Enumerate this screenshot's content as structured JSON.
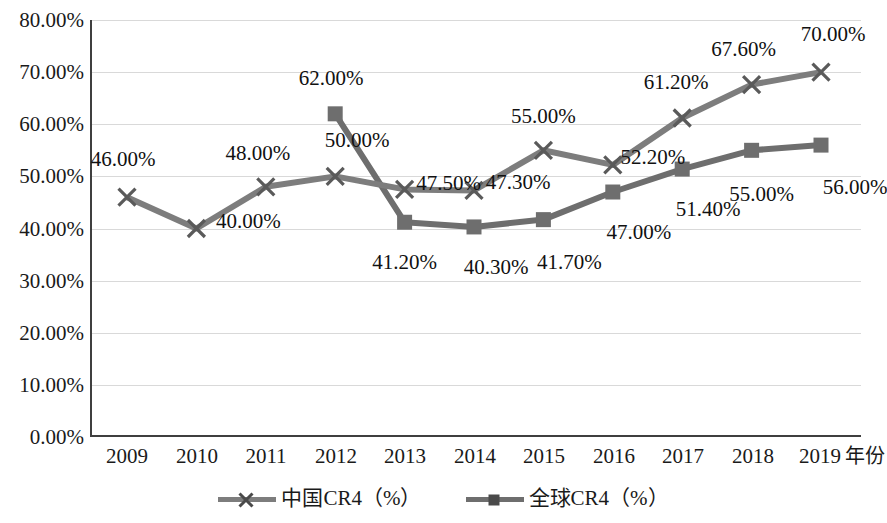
{
  "chart_data": {
    "type": "line",
    "title": "",
    "xlabel": "年份",
    "ylabel": "",
    "grid": true,
    "legend_position": "bottom",
    "categories": [
      "2009",
      "2010",
      "2011",
      "2012",
      "2013",
      "2014",
      "2015",
      "2016",
      "2017",
      "2018",
      "2019"
    ],
    "ylim": [
      0,
      80
    ],
    "ytick_labels": [
      "0.00%",
      "10.00%",
      "20.00%",
      "30.00%",
      "40.00%",
      "50.00%",
      "60.00%",
      "70.00%",
      "80.00%"
    ],
    "ytick_values": [
      0,
      10,
      20,
      30,
      40,
      50,
      60,
      70,
      80
    ],
    "series": [
      {
        "name": "中国CR4（%）",
        "marker": "x-marker",
        "color": "#7d7d7d",
        "values": [
          46.0,
          40.0,
          48.0,
          50.0,
          47.5,
          47.3,
          55.0,
          52.2,
          61.2,
          67.6,
          70.0
        ],
        "labels": [
          "46.00%",
          "40.00%",
          "48.00%",
          "50.00%",
          "47.50%",
          "47.30%",
          "55.00%",
          "52.20%",
          "61.20%",
          "67.60%",
          "70.00%"
        ]
      },
      {
        "name": "全球CR4（%）",
        "marker": "square-marker",
        "color": "#6e6e6e",
        "values": [
          null,
          null,
          null,
          62.0,
          41.2,
          40.3,
          41.7,
          47.0,
          51.4,
          55.0,
          56.0
        ],
        "labels": [
          null,
          null,
          null,
          "62.00%",
          "41.20%",
          "40.30%",
          "41.70%",
          "47.00%",
          "51.40%",
          "55.00%",
          "56.00%"
        ]
      }
    ]
  },
  "axis": {
    "y_ticks": [
      {
        "label": "80.00%",
        "value": 80
      },
      {
        "label": "70.00%",
        "value": 70
      },
      {
        "label": "60.00%",
        "value": 60
      },
      {
        "label": "50.00%",
        "value": 50
      },
      {
        "label": "40.00%",
        "value": 40
      },
      {
        "label": "30.00%",
        "value": 30
      },
      {
        "label": "20.00%",
        "value": 20
      },
      {
        "label": "10.00%",
        "value": 10
      },
      {
        "label": "0.00%",
        "value": 0
      }
    ],
    "x_ticks": [
      "2009",
      "2010",
      "2011",
      "2012",
      "2013",
      "2014",
      "2015",
      "2016",
      "2017",
      "2018",
      "2019"
    ],
    "x_axis_title": "年份"
  },
  "legend": {
    "items": [
      {
        "label": "中国CR4（%）",
        "marker": "x-marker",
        "color": "#7d7d7d"
      },
      {
        "label": "全球CR4（%）",
        "marker": "square-marker",
        "color": "#6e6e6e"
      }
    ]
  },
  "colors": {
    "china_series": "#7d7d7d",
    "global_series": "#6e6e6e",
    "gridline": "#d9d9d9",
    "axis": "#3f3f3f",
    "text": "#111111",
    "background": "#ffffff"
  }
}
